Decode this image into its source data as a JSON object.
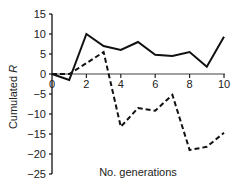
{
  "chart_data": {
    "type": "line",
    "title": "",
    "xlabel": "No. generations",
    "ylabel": "Cumulated R",
    "ylabel_parts": {
      "text": "Cumulated ",
      "italic": "R"
    },
    "x": [
      0,
      1,
      2,
      3,
      4,
      5,
      6,
      7,
      8,
      9,
      10
    ],
    "xlim": [
      0,
      10
    ],
    "ylim": [
      -25,
      15
    ],
    "xticks": [
      0,
      2,
      4,
      6,
      8,
      10
    ],
    "yticks": [
      15,
      10,
      5,
      0,
      -5,
      -10,
      -15,
      -20,
      -25
    ],
    "ytick_labels": [
      "15",
      "10",
      "5",
      "0",
      "−5",
      "−10",
      "−15",
      "−20",
      "−25"
    ],
    "grid": false,
    "legend": null,
    "series": [
      {
        "name": "solid",
        "style": "solid",
        "color": "#111111",
        "values": [
          0,
          -1.5,
          10,
          7,
          6,
          8,
          4.8,
          4.5,
          5.5,
          1.8,
          9.3
        ]
      },
      {
        "name": "dashed",
        "style": "dashed",
        "color": "#111111",
        "values": [
          0,
          0,
          2.7,
          5.5,
          -13.2,
          -8.5,
          -9.2,
          -5.2,
          -19,
          -18.2,
          -14.7
        ]
      }
    ],
    "colors": {
      "y_axis": "#111111",
      "x_axis": "#808080"
    }
  }
}
